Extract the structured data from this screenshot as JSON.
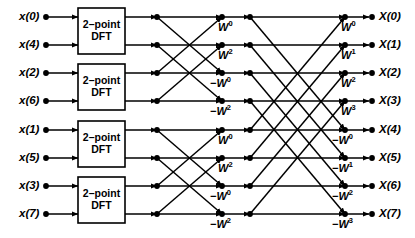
{
  "diagram": {
    "rows": 8,
    "stages": 3,
    "line_color": "#000000",
    "node_color": "#000000",
    "background": "#ffffff"
  },
  "inputs": [
    {
      "label": "x(0)",
      "base": "x",
      "index": "0",
      "row": 0
    },
    {
      "label": "x(4)",
      "base": "x",
      "index": "4",
      "row": 1
    },
    {
      "label": "x(2)",
      "base": "x",
      "index": "2",
      "row": 2
    },
    {
      "label": "x(6)",
      "base": "x",
      "index": "6",
      "row": 3
    },
    {
      "label": "x(1)",
      "base": "x",
      "index": "1",
      "row": 4
    },
    {
      "label": "x(5)",
      "base": "x",
      "index": "5",
      "row": 5
    },
    {
      "label": "x(3)",
      "base": "x",
      "index": "3",
      "row": 6
    },
    {
      "label": "x(7)",
      "base": "x",
      "index": "7",
      "row": 7
    }
  ],
  "outputs": [
    {
      "label": "X(0)",
      "base": "X",
      "index": "0",
      "row": 0
    },
    {
      "label": "X(1)",
      "base": "X",
      "index": "1",
      "row": 1
    },
    {
      "label": "X(2)",
      "base": "X",
      "index": "2",
      "row": 2
    },
    {
      "label": "X(3)",
      "base": "X",
      "index": "3",
      "row": 3
    },
    {
      "label": "X(4)",
      "base": "X",
      "index": "4",
      "row": 4
    },
    {
      "label": "X(5)",
      "base": "X",
      "index": "5",
      "row": 5
    },
    {
      "label": "X(6)",
      "base": "X",
      "index": "6",
      "row": 6
    },
    {
      "label": "X(7)",
      "base": "X",
      "index": "7",
      "row": 7
    }
  ],
  "dft_blocks": [
    {
      "line1": "2–point",
      "line2": "DFT",
      "rows": [
        0,
        1
      ]
    },
    {
      "line1": "2–point",
      "line2": "DFT",
      "rows": [
        2,
        3
      ]
    },
    {
      "line1": "2–point",
      "line2": "DFT",
      "rows": [
        4,
        5
      ]
    },
    {
      "line1": "2–point",
      "line2": "DFT",
      "rows": [
        6,
        7
      ]
    }
  ],
  "stage2_twiddles": [
    {
      "sign": "",
      "base": "W",
      "exp": "0",
      "row": 0
    },
    {
      "sign": "",
      "base": "W",
      "exp": "2",
      "row": 1
    },
    {
      "sign": "−",
      "base": "W",
      "exp": "0",
      "row": 2
    },
    {
      "sign": "−",
      "base": "W",
      "exp": "2",
      "row": 3
    },
    {
      "sign": "",
      "base": "W",
      "exp": "0",
      "row": 4
    },
    {
      "sign": "",
      "base": "W",
      "exp": "2",
      "row": 5
    },
    {
      "sign": "−",
      "base": "W",
      "exp": "0",
      "row": 6
    },
    {
      "sign": "−",
      "base": "W",
      "exp": "2",
      "row": 7
    }
  ],
  "stage3_twiddles": [
    {
      "sign": "",
      "base": "W",
      "exp": "0",
      "row": 0
    },
    {
      "sign": "",
      "base": "W",
      "exp": "1",
      "row": 1
    },
    {
      "sign": "",
      "base": "W",
      "exp": "2",
      "row": 2
    },
    {
      "sign": "",
      "base": "W",
      "exp": "3",
      "row": 3
    },
    {
      "sign": "−",
      "base": "W",
      "exp": "0",
      "row": 4
    },
    {
      "sign": "−",
      "base": "W",
      "exp": "1",
      "row": 5
    },
    {
      "sign": "−",
      "base": "W",
      "exp": "2",
      "row": 6
    },
    {
      "sign": "−",
      "base": "W",
      "exp": "3",
      "row": 7
    }
  ],
  "geometry": {
    "row_y": [
      17,
      45,
      73,
      101,
      130,
      158,
      186,
      214
    ],
    "x_input_dot": 46,
    "x_box_left": 78,
    "x_box_right": 125,
    "x_node_a": 157,
    "x_node_b": 222,
    "x_node_c": 250,
    "x_node_d": 345,
    "x_output_dot": 372
  }
}
